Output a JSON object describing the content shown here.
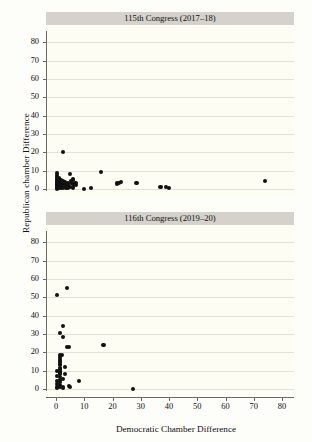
{
  "chart_data": {
    "type": "scatter",
    "title": "",
    "xlabel": "Democratic Chamber Difference",
    "ylabel": "Republican chamber Difference",
    "xlim": [
      0,
      80
    ],
    "ylim": [
      0,
      85
    ],
    "xticks": [
      0,
      10,
      20,
      30,
      40,
      50,
      60,
      70,
      80
    ],
    "yticks": [
      0,
      10,
      20,
      30,
      40,
      50,
      60,
      70,
      80
    ],
    "xtick_labels": [
      "0",
      "10",
      "20",
      "30",
      "40",
      "50",
      "60",
      "70",
      "80"
    ],
    "ytick_labels": [
      "0",
      "10",
      "20",
      "30",
      "40",
      "50",
      "60",
      "70",
      "80"
    ],
    "grid": "horizontal",
    "legend": "none",
    "marker_color": "#111111",
    "panel_background": "#fdfdf4",
    "strip_background": "#d4d2cb",
    "panels": [
      {
        "title": "115th Congress (2017–18)",
        "points": [
          [
            0.2,
            8.6
          ],
          [
            0.3,
            7.4
          ],
          [
            0.2,
            6.5
          ],
          [
            0.4,
            5.8
          ],
          [
            0.2,
            5.0
          ],
          [
            0.3,
            4.3
          ],
          [
            0.2,
            3.6
          ],
          [
            0.4,
            3.0
          ],
          [
            0.2,
            2.4
          ],
          [
            0.3,
            1.8
          ],
          [
            0.2,
            1.2
          ],
          [
            0.4,
            0.6
          ],
          [
            0.2,
            0.2
          ],
          [
            0.9,
            6.2
          ],
          [
            1.0,
            5.2
          ],
          [
            0.9,
            4.4
          ],
          [
            1.1,
            3.7
          ],
          [
            0.9,
            3.0
          ],
          [
            1.0,
            2.3
          ],
          [
            1.1,
            1.6
          ],
          [
            0.9,
            1.0
          ],
          [
            1.0,
            0.4
          ],
          [
            1.7,
            5.0
          ],
          [
            1.8,
            4.1
          ],
          [
            1.7,
            3.3
          ],
          [
            1.9,
            2.6
          ],
          [
            1.7,
            1.9
          ],
          [
            1.8,
            1.2
          ],
          [
            1.9,
            0.5
          ],
          [
            2.5,
            4.3
          ],
          [
            2.6,
            3.4
          ],
          [
            2.5,
            2.6
          ],
          [
            2.7,
            1.8
          ],
          [
            2.6,
            1.0
          ],
          [
            2.5,
            0.3
          ],
          [
            3.3,
            3.8
          ],
          [
            3.4,
            2.9
          ],
          [
            3.3,
            2.0
          ],
          [
            3.5,
            1.1
          ],
          [
            3.4,
            0.4
          ],
          [
            4.2,
            3.4
          ],
          [
            4.3,
            2.4
          ],
          [
            4.2,
            1.4
          ],
          [
            4.4,
            0.6
          ],
          [
            5.1,
            8.0
          ],
          [
            5.2,
            4.6
          ],
          [
            5.3,
            3.2
          ],
          [
            5.1,
            1.2
          ],
          [
            6.0,
            5.6
          ],
          [
            6.1,
            4.8
          ],
          [
            6.2,
            2.8
          ],
          [
            6.0,
            0.8
          ],
          [
            6.9,
            3.4
          ],
          [
            7.0,
            2.4
          ],
          [
            2.5,
            20.0
          ],
          [
            9.8,
            0.2
          ],
          [
            12.4,
            0.3
          ],
          [
            16.0,
            9.5
          ],
          [
            21.5,
            3.0
          ],
          [
            22.3,
            3.4
          ],
          [
            23.0,
            3.6
          ],
          [
            28.5,
            3.2
          ],
          [
            37.0,
            1.2
          ],
          [
            39.0,
            1.0
          ],
          [
            40.0,
            0.4
          ],
          [
            74.0,
            4.5
          ]
        ]
      },
      {
        "title": "116th Congress (2019–20)",
        "points": [
          [
            0.2,
            51.0
          ],
          [
            4.0,
            55.2
          ],
          [
            2.5,
            34.2
          ],
          [
            1.4,
            30.6
          ],
          [
            2.4,
            28.2
          ],
          [
            3.9,
            22.7
          ],
          [
            4.6,
            22.7
          ],
          [
            16.8,
            24.1
          ],
          [
            1.5,
            18.6
          ],
          [
            2.1,
            18.4
          ],
          [
            1.4,
            17.2
          ],
          [
            1.3,
            16.2
          ],
          [
            1.5,
            15.4
          ],
          [
            1.4,
            14.6
          ],
          [
            1.3,
            13.8
          ],
          [
            1.5,
            13.0
          ],
          [
            3.2,
            12.0
          ],
          [
            1.4,
            11.4
          ],
          [
            1.3,
            10.6
          ],
          [
            1.5,
            9.8
          ],
          [
            0.4,
            9.6
          ],
          [
            1.4,
            9.0
          ],
          [
            3.2,
            8.2
          ],
          [
            1.3,
            8.0
          ],
          [
            0.4,
            7.2
          ],
          [
            1.5,
            6.6
          ],
          [
            2.6,
            5.4
          ],
          [
            1.3,
            5.0
          ],
          [
            8.3,
            4.6
          ],
          [
            0.4,
            4.2
          ],
          [
            1.4,
            3.6
          ],
          [
            0.3,
            2.8
          ],
          [
            1.5,
            2.2
          ],
          [
            4.5,
            1.4
          ],
          [
            5.0,
            1.3
          ],
          [
            0.4,
            1.2
          ],
          [
            1.4,
            0.9
          ],
          [
            2.6,
            0.8
          ],
          [
            0.3,
            0.4
          ],
          [
            27.2,
            0.1
          ]
        ]
      }
    ]
  }
}
